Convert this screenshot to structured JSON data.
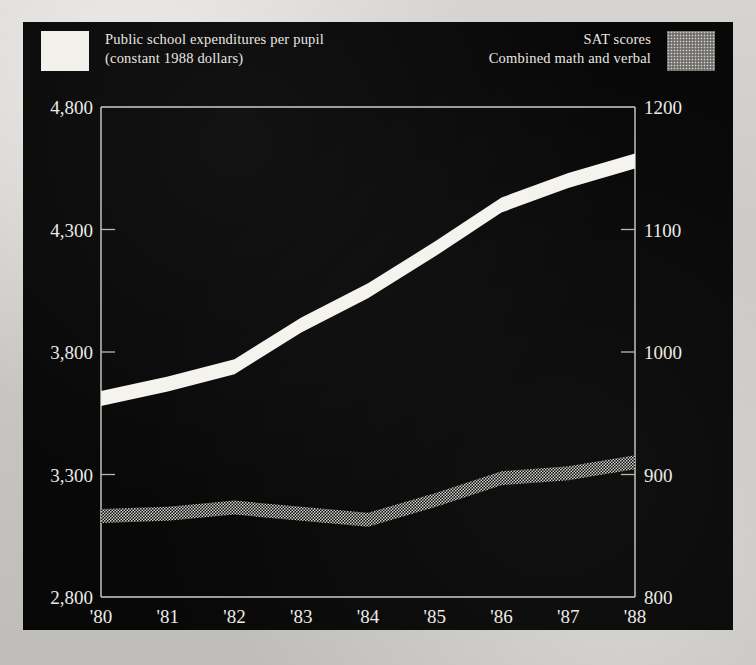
{
  "figure": {
    "background_color": "#080808",
    "paper_color": "#cfcdc9",
    "ink_color": "#eceae4"
  },
  "legend": {
    "left": {
      "swatch": "white-solid-swatch",
      "line1": "Public school expenditures per pupil",
      "line2": "(constant 1988 dollars)"
    },
    "right": {
      "swatch": "gray-stipple-swatch",
      "line1": "SAT scores",
      "line2": "Combined math and verbal"
    }
  },
  "chart_data": {
    "type": "line",
    "title": "",
    "xlabel": "",
    "grid": false,
    "legend_position": "top",
    "x": [
      "'80",
      "'81",
      "'82",
      "'83",
      "'84",
      "'85",
      "'86",
      "'87",
      "'88"
    ],
    "axes": {
      "left": {
        "label": "Public school expenditures per pupil (constant 1988 dollars)",
        "ylim": [
          2800,
          4800
        ],
        "ticks": [
          4800,
          4300,
          3800,
          3300,
          2800
        ],
        "tick_labels": [
          "4,800",
          "4,300",
          "3,800",
          "3,300",
          "2,800"
        ]
      },
      "right": {
        "label": "SAT scores, combined math and verbal",
        "ylim": [
          800,
          1200
        ],
        "ticks": [
          1200,
          1100,
          1000,
          900,
          800
        ],
        "tick_labels": [
          "1200",
          "1100",
          "1000",
          "900",
          "800"
        ]
      }
    },
    "series": [
      {
        "name": "Public school expenditures per pupil",
        "axis": "left",
        "style": "white-thick-band",
        "color": "#f4f3ee",
        "values": [
          3610,
          3670,
          3740,
          3910,
          4050,
          4220,
          4400,
          4500,
          4580
        ]
      },
      {
        "name": "SAT scores combined math and verbal",
        "axis": "right",
        "style": "gray-stipple-band",
        "color": "#d8d6d0",
        "values": [
          866,
          868,
          873,
          868,
          863,
          879,
          897,
          901,
          910
        ]
      }
    ]
  }
}
